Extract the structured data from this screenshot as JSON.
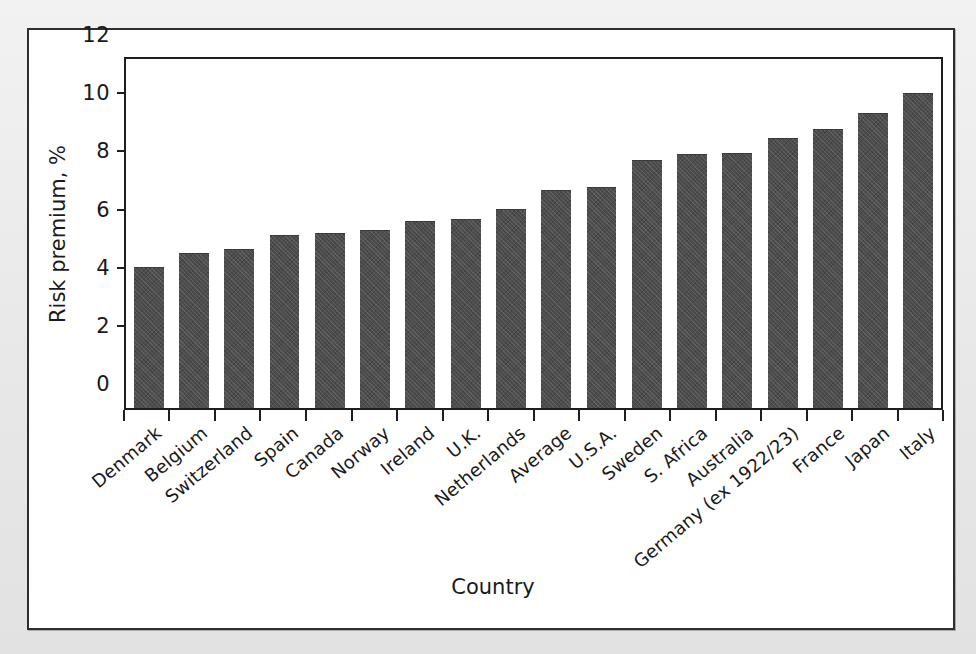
{
  "figure": {
    "background_color": "#ebebeb",
    "frame_color": "#2e2e2e",
    "bar_color": "#4d4d4d"
  },
  "chart_data": {
    "type": "bar",
    "title": "",
    "subtitle": "",
    "xlabel": "Country",
    "ylabel": "Risk premium, %",
    "ylim": [
      0,
      12
    ],
    "yticks": [
      0,
      2,
      4,
      6,
      8,
      10,
      12
    ],
    "ytick_labels": [
      "0",
      "2",
      "4",
      "6",
      "8",
      "10",
      "12"
    ],
    "grid": false,
    "legend": null,
    "orientation": "vertical",
    "categories": [
      "Denmark",
      "Belgium",
      "Switzerland",
      "Spain",
      "Canada",
      "Norway",
      "Ireland",
      "U.K.",
      "Netherlands",
      "Average",
      "U.S.A.",
      "Sweden",
      "S. Africa",
      "Australia",
      "Germany (ex 1922/23)",
      "France",
      "Japan",
      "Italy"
    ],
    "values": [
      4.8,
      5.3,
      5.45,
      5.9,
      6.0,
      6.1,
      6.4,
      6.45,
      6.8,
      7.45,
      7.55,
      8.5,
      8.7,
      8.75,
      9.25,
      9.55,
      10.1,
      10.8
    ]
  }
}
